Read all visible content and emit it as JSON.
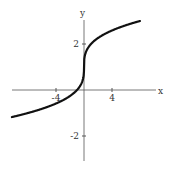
{
  "chart_data": {
    "type": "line",
    "title": "",
    "function": "y = cbrt(x) + 1",
    "xlabel": "x",
    "ylabel": "y",
    "xlim": [
      -10.3,
      10.3
    ],
    "ylim": [
      -3.1,
      3.1
    ],
    "x_ticks": [
      {
        "value": -4,
        "label": "-4"
      },
      {
        "value": 4,
        "label": "4"
      }
    ],
    "y_ticks": [
      {
        "value": 2,
        "label": "2"
      },
      {
        "value": -2,
        "label": "-2"
      }
    ],
    "grid": false,
    "legend": null,
    "series": [
      {
        "name": "curve",
        "color": "#111111",
        "x": [
          -10,
          -8,
          -6,
          -4,
          -2,
          -1,
          -0.5,
          -0.1,
          0,
          0.1,
          0.5,
          1,
          2,
          4,
          6,
          8
        ],
        "y": [
          -1.15,
          -1.0,
          -0.82,
          -0.59,
          -0.26,
          0.0,
          0.21,
          0.54,
          1.0,
          1.46,
          1.79,
          2.0,
          2.26,
          2.59,
          2.82,
          3.0
        ]
      }
    ]
  }
}
